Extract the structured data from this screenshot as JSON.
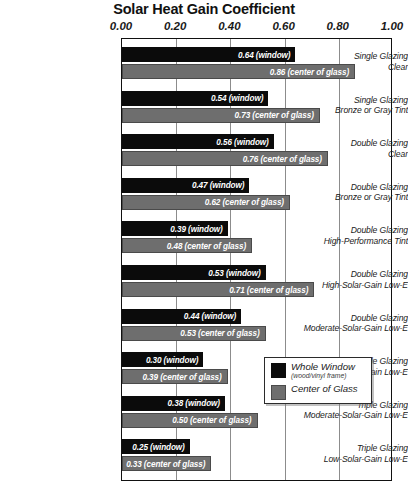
{
  "chart_data": {
    "type": "bar",
    "title": "Solar Heat Gain Coefficient",
    "xlabel": "",
    "ylabel": "",
    "xlim": [
      0.0,
      1.0
    ],
    "grid": true,
    "orientation": "horizontal",
    "legend_position": "inside-bottom-right",
    "xticks": [
      "0.00",
      "0.20",
      "0.40",
      "0.60",
      "0.80",
      "1.00"
    ],
    "xtick_values": [
      0.0,
      0.2,
      0.4,
      0.6,
      0.8,
      1.0
    ],
    "categories": [
      {
        "line1": "Single Glazing",
        "line2": "Clear"
      },
      {
        "line1": "Single Glazing",
        "line2": "Bronze or Gray Tint"
      },
      {
        "line1": "Double Glazing",
        "line2": "Clear"
      },
      {
        "line1": "Double Glazing",
        "line2": "Bronze or Gray Tint"
      },
      {
        "line1": "Double Glazing",
        "line2": "High-Performance Tint"
      },
      {
        "line1": "Double Glazing",
        "line2": "High-Solar-Gain Low-E"
      },
      {
        "line1": "Double Glazing",
        "line2": "Moderate-Solar-Gain Low-E"
      },
      {
        "line1": "Double Glazing",
        "line2": "Low-Solar-Gain Low-E"
      },
      {
        "line1": "Triple Glazing",
        "line2": "Moderate-Solar-Gain Low-E"
      },
      {
        "line1": "Triple Glazing",
        "line2": "Low-Solar-Gain Low-E"
      }
    ],
    "series": [
      {
        "name": "Whole Window",
        "color": "#0b0b0b",
        "values": [
          0.64,
          0.54,
          0.56,
          0.47,
          0.39,
          0.53,
          0.44,
          0.3,
          0.38,
          0.25
        ],
        "labels": [
          "0.64 (window)",
          "0.54 (window)",
          "0.56 (window)",
          "0.47 (window)",
          "0.39 (window)",
          "0.53 (window)",
          "0.44 (window)",
          "0.30 (window)",
          "0.38 (window)",
          "0.25 (window)"
        ]
      },
      {
        "name": "Center of Glass",
        "color": "#6e6e6e",
        "values": [
          0.86,
          0.73,
          0.76,
          0.62,
          0.48,
          0.71,
          0.53,
          0.39,
          0.5,
          0.33
        ],
        "labels": [
          "0.86 (center of glass)",
          "0.73 (center of glass)",
          "0.76 (center of glass)",
          "0.62 (center of glass)",
          "0.48 (center of glass)",
          "0.71 (center of glass)",
          "0.53 (center of glass)",
          "0.39 (center of glass)",
          "0.50 (center of glass)",
          "0.33 (center of glass)"
        ]
      }
    ]
  },
  "legend": {
    "items": [
      {
        "label": "Whole Window",
        "sub": "(wood/vinyl frame)",
        "swatch": "window"
      },
      {
        "label": "Center of Glass",
        "sub": "",
        "swatch": "cog"
      }
    ]
  }
}
